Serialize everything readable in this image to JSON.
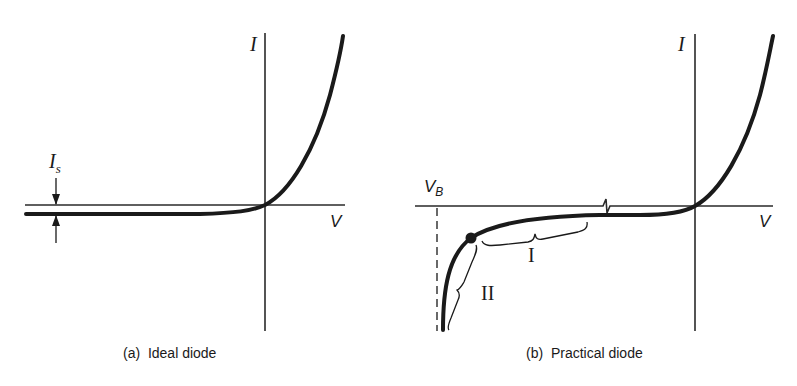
{
  "panels": [
    {
      "id": "a",
      "caption": "(a)  Ideal diode",
      "y_axis_label": "I",
      "x_axis_label": "V",
      "saturation_label": "I",
      "saturation_subscript": "s"
    },
    {
      "id": "b",
      "caption": "(b)  Practical diode",
      "y_axis_label": "I",
      "x_axis_label": "V",
      "breakdown_label": "V",
      "breakdown_subscript": "B",
      "region_labels": [
        "I",
        "II"
      ]
    }
  ],
  "colors": {
    "ink": "#1a1a1a",
    "background": "#ffffff"
  }
}
